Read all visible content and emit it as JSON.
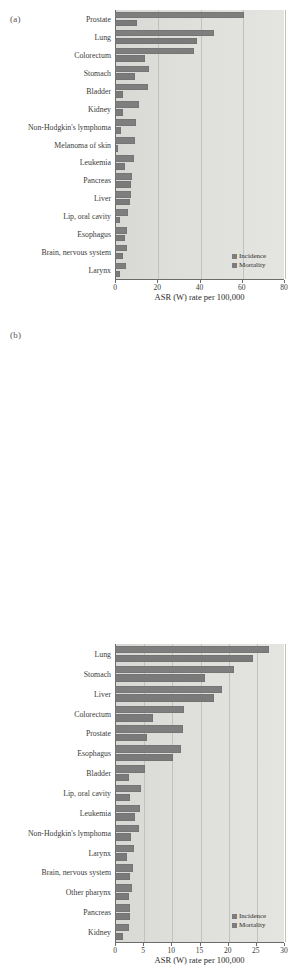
{
  "figure": {
    "panels": [
      {
        "tag": "(a)",
        "axis_title": "ASR (W) rate per 100,000",
        "legend": [
          "Incidence",
          "Mortality"
        ],
        "colors": {
          "incidence": "#7e7e7e",
          "mortality": "#7a7a7a",
          "plot_bg": "#dededa",
          "grid": "#c2c2bd"
        }
      },
      {
        "tag": "(b)",
        "axis_title": "ASR (W) rate per 100,000",
        "legend": [
          "Incidence",
          "Mortality"
        ],
        "colors": {
          "incidence": "#7e7e7e",
          "mortality": "#7a7a7a",
          "plot_bg": "#dededa",
          "grid": "#c2c2bd"
        }
      }
    ]
  },
  "chart_data": [
    {
      "type": "bar",
      "orientation": "horizontal",
      "title": "(a)",
      "xlabel": "ASR (W) rate per 100,000",
      "ylabel": "",
      "xlim": [
        0,
        80
      ],
      "xticks": [
        0,
        20,
        40,
        60,
        80
      ],
      "grid": true,
      "legend_position": "bottom-right",
      "categories": [
        "Prostate",
        "Lung",
        "Colorectum",
        "Stomach",
        "Bladder",
        "Kidney",
        "Non-Hodgkin's lymphoma",
        "Melanoma of skin",
        "Leukemia",
        "Pancreas",
        "Liver",
        "Lip, oral cavity",
        "Esophagus",
        "Brain, nervous system",
        "Larynx"
      ],
      "series": [
        {
          "name": "Incidence",
          "values": [
            61.2,
            46.9,
            37.3,
            16.1,
            15.4,
            11.4,
            9.8,
            9.5,
            8.9,
            8.0,
            7.7,
            6.2,
            5.8,
            5.6,
            5.0
          ]
        },
        {
          "name": "Mortality",
          "values": [
            10.6,
            39.0,
            14.3,
            9.6,
            3.9,
            4.0,
            3.0,
            1.6,
            4.5,
            7.8,
            6.9,
            2.2,
            4.8,
            3.8,
            2.6
          ]
        }
      ]
    },
    {
      "type": "bar",
      "orientation": "horizontal",
      "title": "(b)",
      "xlabel": "ASR (W) rate per 100,000",
      "ylabel": "",
      "xlim": [
        0,
        30
      ],
      "xticks": [
        0,
        5,
        10,
        15,
        20,
        25,
        30
      ],
      "grid": true,
      "legend_position": "bottom-right",
      "categories": [
        "Lung",
        "Stomach",
        "Liver",
        "Colorectum",
        "Prostate",
        "Esophagus",
        "Bladder",
        "Lip, oral cavity",
        "Leukemia",
        "Non-Hodgkin's lymphoma",
        "Larynx",
        "Brain, nervous system",
        "Other pharynx",
        "Pancreas",
        "Kidney"
      ],
      "series": [
        {
          "name": "Incidence",
          "values": [
            27.3,
            21.2,
            19.0,
            12.2,
            12.0,
            11.8,
            5.4,
            4.6,
            4.4,
            4.2,
            3.4,
            3.2,
            3.0,
            2.7,
            2.4
          ]
        },
        {
          "name": "Mortality",
          "values": [
            24.5,
            16.0,
            17.6,
            6.8,
            5.7,
            10.3,
            2.5,
            2.6,
            3.5,
            2.9,
            2.1,
            2.6,
            2.5,
            2.6,
            1.4
          ]
        }
      ]
    }
  ]
}
